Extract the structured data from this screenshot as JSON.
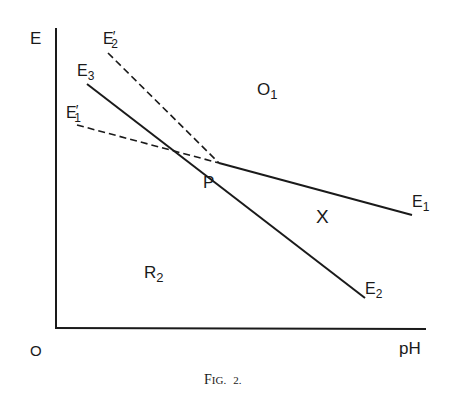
{
  "figure": {
    "caption": "FIG. 2.",
    "caption_prefix_big": "F",
    "caption_prefix_small": "IG.",
    "caption_number": "2."
  },
  "axes": {
    "y_label": "E",
    "x_label": "pH",
    "origin_label": "O"
  },
  "regions": {
    "upper": {
      "main": "O",
      "sub": "1"
    },
    "lower_left": {
      "main": "R",
      "sub": "2"
    },
    "right": {
      "main": "X"
    }
  },
  "point": {
    "label": "P"
  },
  "lines": {
    "E1": {
      "main": "E",
      "sub": "1",
      "style": "solid"
    },
    "E2": {
      "main": "E",
      "sub": "2",
      "style": "solid"
    },
    "E3": {
      "main": "E",
      "sub": "3",
      "style": "solid"
    },
    "E1p": {
      "main": "E",
      "prime": "′",
      "sub": "1",
      "style": "dashed"
    },
    "E2p": {
      "main": "E",
      "prime": "′",
      "sub": "2",
      "style": "dashed"
    }
  },
  "colors": {
    "ink": "#1a1a1a",
    "background": "#ffffff"
  }
}
